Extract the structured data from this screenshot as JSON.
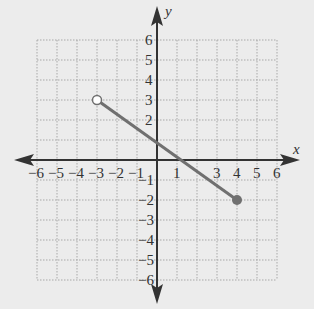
{
  "chart_data": {
    "type": "line",
    "title": "",
    "xlabel": "x",
    "ylabel": "y",
    "xlim": [
      -6,
      6
    ],
    "ylim": [
      -6,
      6
    ],
    "grid": true,
    "x_ticks": [
      "-6",
      "-5",
      "-4",
      "-3",
      "-2",
      "-1",
      "1",
      "3",
      "4",
      "5",
      "6"
    ],
    "y_ticks": [
      "6",
      "5",
      "4",
      "3",
      "2",
      "-1",
      "-2",
      "-3",
      "-4",
      "-5",
      "-6"
    ],
    "series": [
      {
        "name": "segment",
        "points": [
          {
            "x": -3,
            "y": 3
          },
          {
            "x": 4,
            "y": -2
          }
        ],
        "start_endpoint": "open",
        "end_endpoint": "closed"
      }
    ],
    "colors": {
      "line": "#707070",
      "axis": "#333333",
      "grid": "#a8a8a8",
      "background": "#ececec"
    }
  }
}
